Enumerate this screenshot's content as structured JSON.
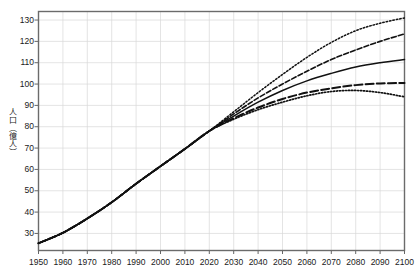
{
  "chart_data": {
    "type": "line",
    "title": "",
    "xlabel": "",
    "ylabel": "人口（億人）",
    "xlim": [
      1950,
      2100
    ],
    "ylim": [
      22,
      134
    ],
    "grid": true,
    "legend_position": "none",
    "xticks": [
      1950,
      1960,
      1970,
      1980,
      1990,
      2000,
      2010,
      2020,
      2030,
      2040,
      2050,
      2060,
      2070,
      2080,
      2090,
      2100
    ],
    "yticks": [
      30,
      40,
      50,
      60,
      70,
      80,
      90,
      100,
      110,
      120,
      130
    ],
    "x": [
      1950,
      1960,
      1970,
      1980,
      1990,
      2000,
      2010,
      2020,
      2030,
      2040,
      2050,
      2060,
      2070,
      2080,
      2090,
      2100
    ],
    "series": [
      {
        "name": "high-variant",
        "style": "dotted",
        "values": [
          25.4,
          30.3,
          37.0,
          44.6,
          53.3,
          61.5,
          69.6,
          78.0,
          87.0,
          96.0,
          104.5,
          112.5,
          119.5,
          125.0,
          128.5,
          131.0
        ]
      },
      {
        "name": "medium-high-variant",
        "style": "dashed",
        "values": [
          25.4,
          30.3,
          37.0,
          44.6,
          53.3,
          61.5,
          69.6,
          78.0,
          86.0,
          93.5,
          100.0,
          106.0,
          111.5,
          116.0,
          120.0,
          123.5
        ]
      },
      {
        "name": "medium-variant",
        "style": "solid",
        "values": [
          25.4,
          30.3,
          37.0,
          44.6,
          53.3,
          61.5,
          69.6,
          78.0,
          85.0,
          91.5,
          97.0,
          101.5,
          105.0,
          108.0,
          110.0,
          111.5
        ]
      },
      {
        "name": "low-medium-variant",
        "style": "long-dashed",
        "values": [
          25.4,
          30.3,
          37.0,
          44.6,
          53.3,
          61.5,
          69.6,
          78.0,
          84.0,
          89.0,
          93.0,
          96.0,
          98.0,
          99.5,
          100.3,
          100.5
        ]
      },
      {
        "name": "low-variant",
        "style": "fine-dotted",
        "values": [
          25.4,
          30.3,
          37.0,
          44.6,
          53.3,
          61.5,
          69.6,
          78.0,
          83.5,
          88.0,
          91.5,
          94.5,
          96.5,
          97.0,
          96.0,
          94.0
        ]
      }
    ]
  },
  "axes": {
    "y_title": "人口（億人）",
    "y_labels": [
      "130",
      "120",
      "110",
      "100",
      "90",
      "80",
      "70",
      "60",
      "50",
      "40",
      "30"
    ],
    "x_labels": [
      "1950",
      "1960",
      "1970",
      "1980",
      "1990",
      "2000",
      "2010",
      "2020",
      "2030",
      "2040",
      "2050",
      "2060",
      "2070",
      "2080",
      "2090",
      "2100"
    ]
  },
  "colors": {
    "line": "#111111",
    "grid": "#d9d9d9",
    "frame": "#6b6b6b",
    "text": "#1a1a1a",
    "background": "#ffffff"
  }
}
